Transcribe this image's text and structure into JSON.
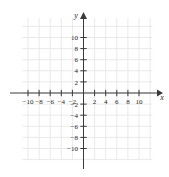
{
  "figure": {
    "kind": "coordinate-plane",
    "background_color": "#ffffff",
    "grid_color": "#e9e9ea",
    "axis_color": "#3a3a3c",
    "label_color": "#231f20"
  },
  "axes": {
    "x_axis_label": "x",
    "y_axis_label": "y",
    "x_arrow": "right",
    "y_arrow": "up"
  },
  "chart_data": {
    "type": "scatter",
    "title": "",
    "subtitle": "",
    "xlabel": "x",
    "ylabel": "y",
    "xlim": [
      -12,
      12
    ],
    "ylim": [
      -12,
      12
    ],
    "x_ticks": [
      -10,
      -8,
      -6,
      -4,
      -2,
      2,
      4,
      6,
      8,
      10
    ],
    "y_ticks": [
      10,
      8,
      6,
      4,
      2,
      -2,
      -4,
      -6,
      -8,
      -10
    ],
    "x_tick_labels": [
      "-10",
      "-8",
      "-6",
      "-4",
      "-2",
      "2",
      "4",
      "6",
      "8",
      "10"
    ],
    "y_tick_labels": [
      "10",
      "8",
      "6",
      "4",
      "2",
      "-2",
      "-4",
      "-6",
      "-8",
      "-10"
    ],
    "tick_step": 2,
    "grid": true,
    "grid_step": 2,
    "legend": null,
    "series": [],
    "values": [],
    "categories": [],
    "annotations": []
  }
}
